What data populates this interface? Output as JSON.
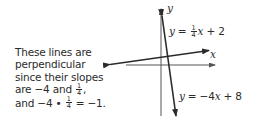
{
  "explanation": {
    "lines": [
      "These lines are",
      "perpendicular",
      "since their slopes",
      "are −4 and ",
      "and −4 • "
    ],
    "slope_fraction": {
      "num": "1",
      "den": "4"
    },
    "line4_suffix": ",",
    "line5_suffix": " = −1."
  },
  "graph": {
    "x_axis_label": "x",
    "y_axis_label": "y",
    "line1": {
      "prefix": "y",
      "eq": " = ",
      "frac": {
        "num": "1",
        "den": "4"
      },
      "var": "x",
      "rest": " + 2",
      "slope": 0.25,
      "intercept": 2
    },
    "line2": {
      "prefix": "y",
      "eq": " = −4",
      "var": "x",
      "rest": " + 8",
      "slope": -4,
      "intercept": 8
    },
    "colors": {
      "axis": "#555555",
      "line": "#2b2b2b",
      "text": "#2b2b2b"
    }
  }
}
